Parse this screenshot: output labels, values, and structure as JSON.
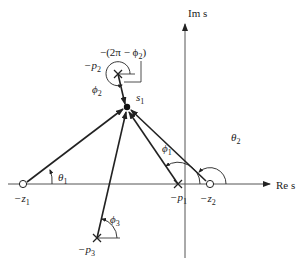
{
  "diagram": {
    "type": "s-plane pole-zero angle diagram",
    "axes": {
      "real_label": "Re s",
      "imag_label": "Im s"
    },
    "test_point": {
      "label": "s",
      "subscript": "1"
    },
    "zeros": [
      {
        "label": "−z",
        "subscript": "1"
      },
      {
        "label": "−z",
        "subscript": "2"
      }
    ],
    "poles": [
      {
        "label": "−p",
        "subscript": "1"
      },
      {
        "label": "−p",
        "subscript": "2"
      },
      {
        "label": "−p",
        "subscript": "3"
      }
    ],
    "angles": [
      {
        "symbol": "θ",
        "subscript": "1"
      },
      {
        "symbol": "θ",
        "subscript": "2"
      },
      {
        "symbol": "ϕ",
        "subscript": "1"
      },
      {
        "symbol": "ϕ",
        "subscript": "2"
      },
      {
        "symbol": "ϕ",
        "subscript": "3"
      }
    ],
    "annotation": {
      "text": "−(2π − ϕ",
      "subscript": "2",
      "close": ")"
    }
  },
  "colors": {
    "line": "#222222",
    "axis": "#555555",
    "background": "#ffffff"
  }
}
